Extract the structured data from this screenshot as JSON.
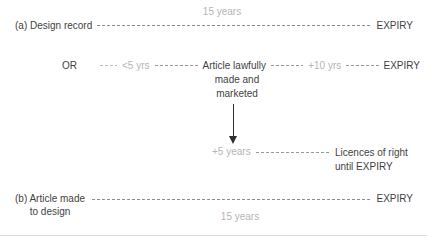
{
  "colors": {
    "text_dark": "#3f3f3f",
    "text_light": "#b5b5b5",
    "dash_main": "#8c8c8c",
    "arrow": "#2e2e2e"
  },
  "timeline_a": {
    "label": "(a) Design record",
    "duration": "15 years",
    "expiry": "EXPIRY"
  },
  "timeline_or": {
    "or": "OR",
    "segment_before": "<5 yrs",
    "event_line1": "Article lawfully",
    "event_line2": "made and",
    "event_line3": "marketed",
    "segment_after": "+10 yrs",
    "expiry": "EXPIRY"
  },
  "licences": {
    "duration": "+5 years",
    "label_line1": "Licences of right",
    "label_line2": "until EXPIRY"
  },
  "timeline_b": {
    "label_line1": "(b) Article made",
    "label_line2": "to design",
    "duration": "15 years",
    "expiry": "EXPIRY"
  }
}
